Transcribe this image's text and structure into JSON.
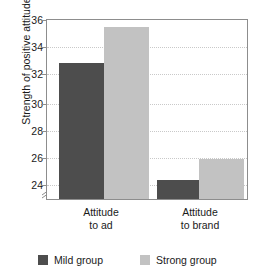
{
  "chart_data": {
    "type": "bar",
    "title": "",
    "xlabel": "",
    "ylabel": "Strength of positive attitude",
    "categories": [
      "Attitude to ad",
      "Attitude to brand"
    ],
    "category_lines": [
      [
        "Attitude",
        "to ad"
      ],
      [
        "Attitude",
        "to brand"
      ]
    ],
    "series": [
      {
        "name": "Mild group",
        "color": "#4d4d4d",
        "values": [
          32.9,
          24.5
        ]
      },
      {
        "name": "Strong group",
        "color": "#c2c2c2",
        "values": [
          35.5,
          26.0
        ]
      }
    ],
    "ylim": [
      23.1,
      36
    ],
    "yticks": [
      24,
      26,
      28,
      30,
      32,
      34,
      36
    ],
    "ytick_labels": [
      "24",
      "26",
      "28",
      "30",
      "32",
      "34",
      "36"
    ],
    "gridlines": [
      24,
      26,
      28,
      30,
      32,
      34
    ],
    "grid": true,
    "axis_break": true,
    "axis_break_icon": "axis-break-slash",
    "legend_position": "bottom"
  },
  "legend": {
    "items": [
      {
        "label": "Mild group",
        "color": "#4d4d4d"
      },
      {
        "label": "Strong group",
        "color": "#c2c2c2"
      }
    ]
  }
}
